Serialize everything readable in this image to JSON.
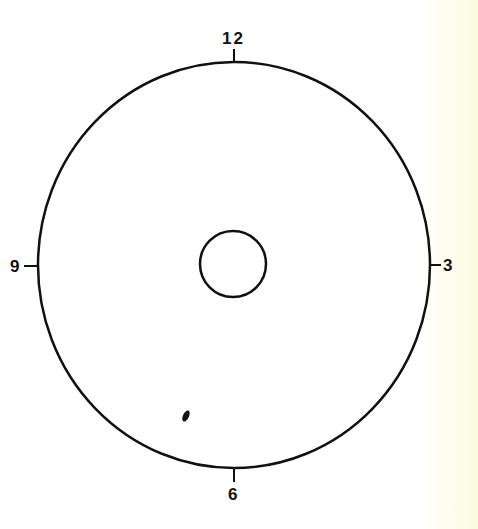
{
  "diagram": {
    "type": "clock-face-disc",
    "colors": {
      "stroke": "#111111",
      "background": "#ffffff",
      "edge_tint": "#fbfbe0"
    },
    "outer_circle": {
      "cx": 234,
      "cy": 265,
      "rx": 196,
      "ry": 203
    },
    "inner_circle": {
      "cx": 233,
      "cy": 264,
      "r": 33
    },
    "marker": {
      "x": 186,
      "y": 416,
      "description": "small dark spot"
    },
    "labels": {
      "top": "12",
      "right": "3",
      "bottom": "6",
      "left": "9"
    }
  }
}
